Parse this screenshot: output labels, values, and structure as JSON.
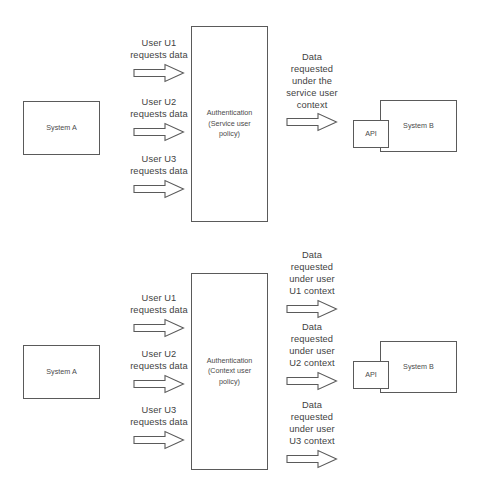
{
  "diagram": {
    "title_fragment": "",
    "colors": {
      "stroke": "#5a5a5a",
      "text": "#3f3f3f",
      "node_text": "#4a4a4a",
      "background": "#ffffff"
    },
    "sections": [
      {
        "id": "service-user-policy",
        "source": {
          "label": "System A"
        },
        "processor": {
          "label": "Authentication\n(Service user\npolicy)"
        },
        "target": {
          "label": "System B",
          "api_label": "API"
        },
        "request_arrows": [
          {
            "label": "User U1\nrequests data"
          },
          {
            "label": "User U2\nrequests data"
          },
          {
            "label": "User U3\nrequests data"
          }
        ],
        "response_arrows": [
          {
            "label": "Data\nrequested\nunder the\nservice user\ncontext"
          }
        ]
      },
      {
        "id": "context-user-policy",
        "source": {
          "label": "System A"
        },
        "processor": {
          "label": "Authentication\n(Context user\npolicy)"
        },
        "target": {
          "label": "System B",
          "api_label": "API"
        },
        "request_arrows": [
          {
            "label": "User U1\nrequests data"
          },
          {
            "label": "User U2\nrequests data"
          },
          {
            "label": "User U3\nrequests data"
          }
        ],
        "response_arrows": [
          {
            "label": "Data\nrequested\nunder user\nU1 context"
          },
          {
            "label": "Data\nrequested\nunder user\nU2 context"
          },
          {
            "label": "Data\nrequested\nunder user\nU3 context"
          }
        ]
      }
    ]
  }
}
